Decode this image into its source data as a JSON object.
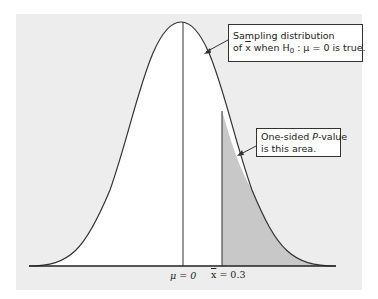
{
  "figure": {
    "type": "normal-distribution-diagram",
    "colors": {
      "background": "#ededed",
      "curve_fill": "#ffffff",
      "shaded_area": "#c8c8c8",
      "line": "#222222"
    }
  },
  "callouts": {
    "sampling": {
      "line1": "Sampling distribution",
      "line2_prefix": "of ",
      "xbar": "x",
      "line2_mid": " when H",
      "sub": "0",
      "line2_suffix": " : μ = 0 is true."
    },
    "pvalue": {
      "line1_prefix": "One-sided ",
      "line1_italic": "P",
      "line1_suffix": "-value",
      "line2": "is this area."
    }
  },
  "axis_labels": {
    "mu": "μ = 0",
    "xbar_symbol": "x",
    "xbar_value": " = 0.3"
  }
}
